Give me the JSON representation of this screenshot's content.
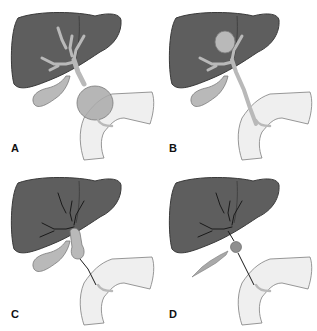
{
  "figure": {
    "colors": {
      "liver": "#5e5e5e",
      "liver_stroke": "#3a3a3a",
      "duct": "#b9b9b9",
      "duct_stroke": "#7a7a7a",
      "duodenum": "#efefef",
      "duodenum_stroke": "#7e7e7e",
      "cyst": "#a9a9a9",
      "thin_duct": "#1a1a1a",
      "background": "#ffffff"
    },
    "panels": [
      {
        "id": "A",
        "label": "A",
        "description": "Fusiform cystic dilation of the common bile duct with mildly dilated intrahepatic ducts"
      },
      {
        "id": "B",
        "label": "B",
        "description": "Intrahepatic cystic dilation with normal-caliber extrahepatic duct"
      },
      {
        "id": "C",
        "label": "C",
        "description": "Focal dilation of the proximal extrahepatic duct with thin intrahepatic and distal ducts"
      },
      {
        "id": "D",
        "label": "D",
        "description": "Small cyst at the hilum with thin, narrowed ducts and atrophic gallbladder"
      }
    ]
  }
}
